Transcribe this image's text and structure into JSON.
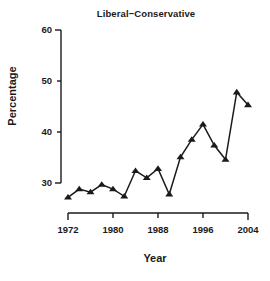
{
  "chart_data": {
    "type": "line",
    "title": "Liberal−Conservative",
    "xlabel": "Year",
    "ylabel": "Percentage",
    "x": [
      1972,
      1974,
      1976,
      1978,
      1980,
      1982,
      1984,
      1986,
      1988,
      1990,
      1992,
      1994,
      1996,
      1998,
      2000,
      2002,
      2004
    ],
    "values": [
      27.2,
      28.8,
      28.2,
      29.7,
      28.8,
      27.4,
      32.4,
      31.0,
      32.8,
      27.8,
      35.1,
      38.5,
      41.5,
      37.4,
      34.6,
      47.8,
      45.3
    ],
    "series": [
      {
        "name": "Liberal−Conservative",
        "values": [
          27.2,
          28.8,
          28.2,
          29.7,
          28.8,
          27.4,
          32.4,
          31.0,
          32.8,
          27.8,
          35.1,
          38.5,
          41.5,
          37.4,
          34.6,
          47.8,
          45.3
        ]
      }
    ],
    "xlim": [
      1971,
      2005
    ],
    "ylim": [
      26,
      60
    ],
    "xticks": [
      1972,
      1980,
      1988,
      1996,
      2004
    ],
    "xtick_labels": [
      "1972",
      "1980",
      "1988",
      "1996",
      "2004"
    ],
    "yticks": [
      30,
      40,
      50,
      60
    ],
    "ytick_labels": [
      "30",
      "40",
      "50",
      "60"
    ],
    "grid": false,
    "legend": "none",
    "marker": "triangle-up",
    "line_color": "#1a1a1a",
    "marker_color": "#1a1a1a",
    "background_color": "#ffffff"
  }
}
